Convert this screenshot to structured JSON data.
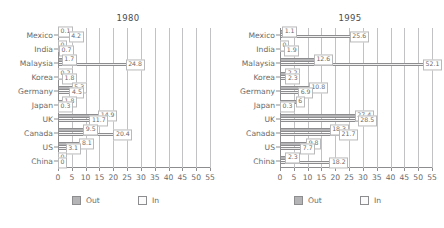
{
  "chart_data": {
    "type": "bar",
    "orientation": "horizontal",
    "title": "",
    "panels": [
      {
        "title": "1980",
        "categories": [
          "Mexico",
          "India",
          "Malaysia",
          "Korea",
          "Germany",
          "Japan",
          "UK",
          "Canada",
          "US",
          "China"
        ],
        "series": [
          {
            "name": "Out",
            "values": [
              0.1,
              0,
              1.7,
              0.2,
              5.3,
              1.8,
              14.9,
              9.5,
              8.1,
              0
            ]
          },
          {
            "name": "In",
            "values": [
              4.2,
              0.7,
              24.8,
              1.8,
              4.5,
              0.3,
              11.7,
              20.4,
              3.1,
              0
            ]
          }
        ],
        "xlabel": "",
        "ylabel": "",
        "xlim": [
          0,
          55
        ],
        "xticks": [
          0,
          5,
          10,
          15,
          20,
          25,
          30,
          35,
          40,
          45,
          50,
          55
        ]
      },
      {
        "title": "1995",
        "categories": [
          "Mexico",
          "India",
          "Malaysia",
          "Korea",
          "Germany",
          "Japan",
          "UK",
          "Canada",
          "US",
          "China"
        ],
        "series": [
          {
            "name": "Out",
            "values": [
              1.1,
              0,
              12.6,
              2.2,
              10.8,
              6,
              27.4,
              18.3,
              9.8,
              2.3
            ]
          },
          {
            "name": "In",
            "values": [
              25.6,
              1.9,
              52.1,
              2.3,
              6.9,
              0.3,
              28.5,
              21.7,
              7.7,
              18.2
            ]
          }
        ],
        "xlabel": "",
        "ylabel": "",
        "xlim": [
          0,
          55
        ],
        "xticks": [
          0,
          5,
          10,
          15,
          20,
          25,
          30,
          35,
          40,
          45,
          50,
          55
        ]
      }
    ],
    "legend": {
      "position": "bottom",
      "entries": [
        {
          "label": "Out",
          "color": "#b4b4b6"
        },
        {
          "label": "In",
          "color": "#fbfbfb"
        }
      ]
    },
    "grid": true,
    "value_labels": true
  },
  "colors": {
    "out": "#b4b4b6",
    "in": "#efefef",
    "axis": "#8d8d8f",
    "grid": "#c2c2c4",
    "text": "#6a6a6c"
  }
}
